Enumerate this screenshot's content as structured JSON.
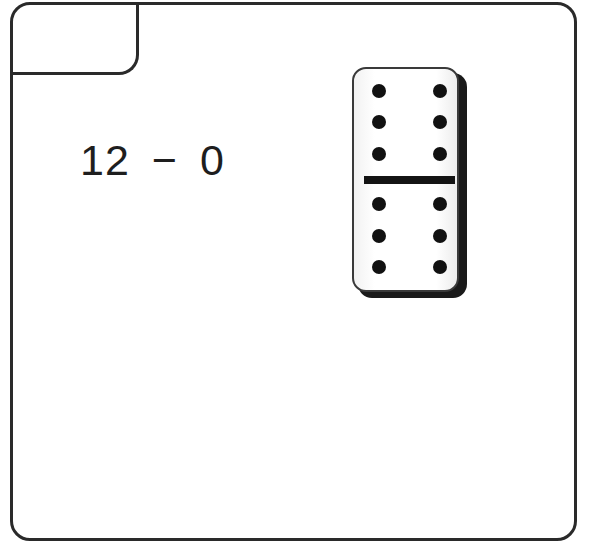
{
  "expression": {
    "left": "12",
    "operator": "−",
    "right": "0"
  },
  "domino": {
    "top_half_pips": 6,
    "bottom_half_pips": 6,
    "pip_color": "#111111",
    "face_color": "#ffffff",
    "shadow_color": "#1a1a1a"
  },
  "colors": {
    "border": "#2a2a2a",
    "text": "#1e1e1e",
    "background": "#ffffff"
  }
}
